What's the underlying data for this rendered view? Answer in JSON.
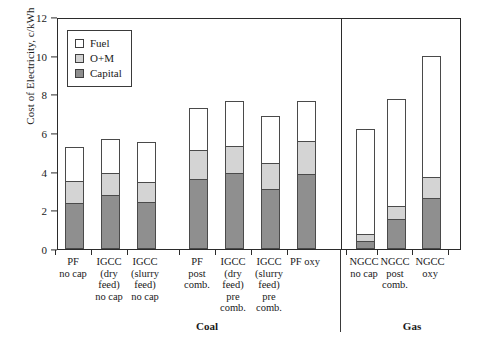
{
  "chart": {
    "type": "bar",
    "title": "",
    "ylabel": "Cost of Electricity, c/kWh",
    "xlabel": ""
  },
  "yaxis": {
    "ticks": [
      "0",
      "2",
      "4",
      "6",
      "8",
      "10",
      "12"
    ],
    "min": 0,
    "max": 12
  },
  "legend": {
    "items": [
      {
        "label": "Fuel",
        "color": "#ffffff"
      },
      {
        "label": "O+M",
        "color": "#d4d4d4"
      },
      {
        "label": "Capital",
        "color": "#8f8f8f"
      }
    ]
  },
  "groups": [
    {
      "label": "Coal"
    },
    {
      "label": "Gas"
    }
  ],
  "chart_data": {
    "type": "bar",
    "subtype": "stacked",
    "title": "",
    "xlabel": "",
    "ylabel": "Cost of Electricity, c/kWh",
    "ylim": [
      0,
      12
    ],
    "yticks": [
      0,
      2,
      4,
      6,
      8,
      10,
      12
    ],
    "grid": false,
    "legend_position": "upper-left",
    "categories": [
      "PF no cap",
      "IGCC (dry feed) no cap",
      "IGCC (slurry feed) no cap",
      "PF post comb.",
      "IGCC (dry feed) pre comb.",
      "IGCC (slurry feed) pre comb.",
      "PF oxy",
      "NGCC no cap",
      "NGCC post comb.",
      "NGCC oxy"
    ],
    "category_lines": [
      [
        "PF",
        "no cap"
      ],
      [
        "IGCC",
        "(dry",
        "feed)",
        "no cap"
      ],
      [
        "IGCC",
        "(slurry",
        "feed)",
        "no cap"
      ],
      [
        "PF",
        "post",
        "comb."
      ],
      [
        "IGCC",
        "(dry",
        "feed)",
        "pre",
        "comb."
      ],
      [
        "IGCC",
        "(slurry",
        "feed)",
        "pre",
        "comb."
      ],
      [
        "PF oxy"
      ],
      [
        "NGCC",
        "no cap"
      ],
      [
        "NGCC",
        "post",
        "comb."
      ],
      [
        "NGCC",
        "oxy"
      ]
    ],
    "group_assignment": [
      "Coal",
      "Coal",
      "Coal",
      "Coal",
      "Coal",
      "Coal",
      "Coal",
      "Gas",
      "Gas",
      "Gas"
    ],
    "series": [
      {
        "name": "Capital",
        "color": "#8f8f8f",
        "values": [
          2.4,
          2.8,
          2.45,
          3.6,
          3.95,
          3.1,
          3.9,
          0.4,
          1.55,
          2.65
        ]
      },
      {
        "name": "O+M",
        "color": "#d4d4d4",
        "values": [
          1.2,
          1.2,
          1.05,
          1.6,
          1.45,
          1.4,
          1.75,
          0.45,
          0.75,
          1.15
        ]
      },
      {
        "name": "Fuel",
        "color": "#ffffff",
        "values": [
          1.8,
          1.8,
          2.15,
          2.2,
          2.35,
          2.5,
          2.1,
          5.45,
          5.55,
          6.3
        ]
      }
    ],
    "totals": [
      5.4,
      5.8,
      5.65,
      7.4,
      7.75,
      7.0,
      7.75,
      6.3,
      7.85,
      10.1
    ]
  }
}
